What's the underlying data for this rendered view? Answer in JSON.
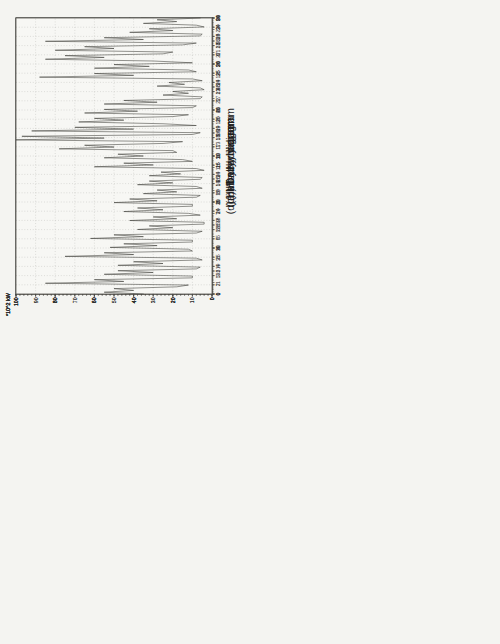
{
  "colors": {
    "paper": "#f4f4f1",
    "plot_background": "#f7f7f4",
    "frame": "#55544f",
    "grid": "#b5b5b0",
    "tick": "#44443f",
    "series": "#3a3a36",
    "text": "#222220"
  },
  "chart_data": [
    {
      "panel": "a",
      "caption": "(a) Hourly diagram",
      "type": "line",
      "unit_label": "*10^2 kW",
      "ylabel": "*10^2 kW",
      "xlabel": "",
      "ylim": [
        0,
        100
      ],
      "y_ticks": [
        0,
        20,
        40,
        60,
        80,
        100
      ],
      "y_minor_step": 2,
      "x_start": 0,
      "x_end": 60,
      "x_minor_step": 1,
      "x_tick_positions": [
        0,
        5,
        10,
        15,
        20,
        25,
        30,
        35,
        40,
        45,
        50,
        55,
        60
      ],
      "x_tick_labels": [
        "0",
        "5",
        "10",
        "15",
        "20",
        "25",
        "30",
        "35",
        "40",
        "45",
        "50",
        "55",
        "60"
      ],
      "values": [
        97,
        99,
        97,
        95,
        93,
        92,
        93,
        94,
        95,
        95,
        94,
        92,
        90,
        88,
        86,
        84,
        82,
        80,
        81,
        80,
        78,
        77,
        75,
        73,
        71,
        69,
        66,
        62,
        57,
        53,
        51,
        50,
        48,
        44,
        41,
        40,
        38,
        37,
        38,
        41,
        39,
        40,
        41,
        40,
        41,
        42,
        41,
        40,
        43,
        44,
        41,
        40,
        41,
        42,
        40,
        36,
        38,
        42,
        45,
        46,
        47
      ]
    },
    {
      "panel": "b",
      "caption": "(b) Daily diagram",
      "type": "line",
      "unit_label": "*10^2 kW",
      "ylabel": "*10^2 kW",
      "xlabel": "",
      "ylim": [
        0,
        100
      ],
      "y_ticks": [
        0,
        20,
        40,
        60,
        80,
        100
      ],
      "y_minor_step": 2,
      "x_start": 0,
      "x_end": 24,
      "x_minor_step": 0.25,
      "x_tick_positions": [
        0,
        1,
        2,
        3,
        4,
        5,
        6,
        7,
        8,
        9,
        10,
        11,
        12,
        13,
        14,
        15,
        16,
        17,
        18,
        19,
        20,
        21,
        22,
        23,
        24
      ],
      "x_tick_labels": [
        "0",
        "1",
        "2",
        "3",
        "4",
        "5",
        "6",
        "7",
        "8",
        "9",
        "10",
        "11",
        "12",
        "13",
        "14",
        "15",
        "16",
        "17",
        "18",
        "19",
        "20",
        "21",
        "22",
        "23",
        "24"
      ],
      "values": [
        30,
        28,
        31,
        29,
        30,
        32,
        29,
        28,
        30,
        27,
        28,
        31,
        33,
        36,
        40,
        45,
        52,
        46,
        41,
        39,
        42,
        46,
        43,
        40,
        42,
        47,
        51,
        46,
        49,
        53,
        48,
        45,
        48,
        50,
        47,
        50,
        54,
        57,
        55,
        53,
        56,
        60,
        57,
        59,
        62,
        70,
        77,
        68,
        71,
        65,
        60,
        57,
        55,
        52,
        49,
        46,
        44,
        42,
        41,
        40,
        38,
        36,
        34,
        33,
        32,
        34,
        38,
        42,
        47,
        52,
        57,
        61,
        64,
        62,
        65,
        63,
        61,
        74,
        58,
        55,
        65,
        70,
        73,
        68,
        72,
        80,
        90,
        98,
        95,
        85,
        60,
        45,
        48,
        55,
        40,
        37,
        42
      ]
    },
    {
      "panel": "c",
      "caption": "(c) Monthly diagram",
      "type": "line",
      "unit_label": "*10^2 kW",
      "ylabel": "*10^2 kW",
      "xlabel": "",
      "ylim": [
        0,
        100
      ],
      "y_ticks": [
        0,
        10,
        20,
        30,
        40,
        50,
        60,
        70,
        80,
        90,
        100
      ],
      "y_minor_step": 2,
      "x_start": 1,
      "x_end": 31,
      "x_minor_step": 0.25,
      "x_tick_positions": [
        1,
        2,
        3,
        4,
        5,
        6,
        7,
        8,
        9,
        10,
        11,
        12,
        13,
        14,
        15,
        16,
        17,
        18,
        19,
        20,
        21,
        22,
        23,
        24,
        25,
        26,
        27,
        28,
        29,
        30,
        31
      ],
      "x_tick_labels": [
        "1",
        "2",
        "3",
        "4",
        "5",
        "6",
        "7",
        "8",
        "9",
        "10",
        "11",
        "12",
        "13",
        "14",
        "15",
        "16",
        "17",
        "18",
        "19",
        "20",
        "21",
        "22",
        "23",
        "24",
        "25",
        "26",
        "27",
        "28",
        "29",
        "30",
        "31"
      ],
      "values": [
        35,
        55,
        40,
        50,
        18,
        12,
        85,
        45,
        60,
        10,
        10,
        55,
        30,
        48,
        8,
        6,
        48,
        25,
        40,
        5,
        8,
        75,
        40,
        55,
        10,
        12,
        52,
        28,
        45,
        10,
        10,
        62,
        35,
        50,
        8,
        5,
        38,
        20,
        32,
        4,
        4,
        42,
        18,
        30,
        6,
        12,
        45,
        25,
        38,
        10,
        10,
        50,
        28,
        42,
        8,
        6,
        35,
        18,
        28,
        5,
        8,
        38,
        20,
        32,
        6,
        5,
        32,
        16,
        26,
        4,
        8,
        60,
        30,
        45,
        10,
        15,
        55,
        35,
        48,
        18,
        20,
        78,
        50,
        65,
        25,
        15,
        100,
        55,
        97,
        10,
        6,
        92,
        40,
        70,
        8,
        25,
        68,
        45,
        60,
        20,
        12,
        65,
        38,
        55,
        10,
        8,
        55,
        28,
        45,
        6,
        5,
        25,
        12,
        20,
        4,
        6,
        28,
        14,
        22,
        5,
        10,
        88,
        40,
        60,
        8,
        12,
        60,
        32,
        50,
        10,
        30,
        85,
        55,
        75,
        25,
        20,
        80,
        50,
        65,
        15,
        8,
        85,
        35,
        55,
        6,
        5,
        42,
        20,
        32,
        4,
        8,
        35,
        18,
        28,
        6
      ]
    },
    {
      "panel": "d",
      "caption": "(d) Half-yearly diagram",
      "type": "line",
      "unit_label": "*10^2 kW",
      "ylabel": "*10^2 kW",
      "xlabel": "",
      "ylim": [
        0,
        100
      ],
      "y_ticks": [
        0,
        10,
        20,
        30,
        40,
        50,
        60,
        70,
        80,
        90,
        100
      ],
      "y_minor_step": 2,
      "x_start": 1,
      "x_end": 181,
      "x_minor_step": 1,
      "x_tick_positions": [
        1,
        7,
        13,
        19,
        25,
        31,
        37,
        43,
        49,
        55,
        61,
        67,
        73,
        79,
        85,
        91,
        97,
        103,
        109,
        115,
        121,
        127,
        133,
        139,
        145,
        151,
        157,
        163,
        169,
        175,
        181
      ],
      "x_tick_labels": [
        "1",
        "7",
        "13",
        "19",
        "25",
        "31",
        "6",
        "12",
        "18",
        "24",
        "2",
        "8",
        "14",
        "20",
        "26",
        "1",
        "7",
        "13",
        "19",
        "25",
        "1",
        "7",
        "13",
        "19",
        "25",
        "31",
        "6",
        "12",
        "18",
        "24",
        "30"
      ],
      "values": [
        15,
        58,
        12,
        55,
        18,
        62,
        14,
        56,
        24,
        34,
        20,
        30,
        26,
        36,
        22,
        32,
        18,
        55,
        15,
        65,
        20,
        70,
        16,
        62,
        22,
        68,
        18,
        75,
        25,
        72,
        20,
        66,
        25,
        72,
        20,
        80,
        28,
        76,
        22,
        85,
        30,
        78,
        24,
        70,
        26,
        82,
        20,
        75,
        28,
        84,
        22,
        78,
        30,
        72,
        25,
        80,
        18,
        68,
        26,
        76,
        28,
        80,
        22,
        88,
        30,
        84,
        25,
        92,
        32,
        86,
        26,
        78,
        30,
        90,
        28,
        96,
        35,
        100,
        30,
        88,
        26,
        84,
        32,
        90,
        28,
        82,
        24,
        86,
        30,
        78,
        25,
        82,
        30,
        76,
        22,
        70,
        28,
        74,
        24,
        66,
        26,
        72,
        22,
        62,
        28,
        45,
        24,
        40,
        30,
        48,
        26,
        42,
        20,
        58,
        24,
        64,
        18,
        56,
        22,
        60,
        15,
        62,
        20,
        70,
        12,
        58,
        18,
        66,
        22,
        72,
        14,
        60,
        20,
        68,
        16,
        64,
        12,
        58,
        18,
        64,
        10,
        52,
        16,
        60,
        20,
        66,
        12,
        54,
        18,
        62,
        14,
        56,
        10,
        50,
        15,
        58,
        8,
        45,
        12,
        52,
        16,
        60,
        10,
        46,
        14,
        54,
        6,
        40,
        10,
        48,
        5,
        35,
        8,
        42,
        12,
        50,
        4,
        28,
        8,
        36
      ]
    }
  ]
}
